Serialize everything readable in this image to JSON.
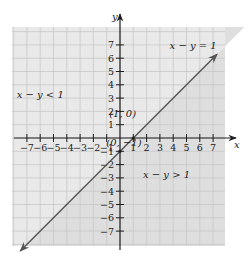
{
  "chart_data": {
    "type": "line",
    "title": "",
    "xlabel": "x",
    "ylabel": "y",
    "xlim": [
      -7,
      7
    ],
    "ylim": [
      -7,
      7
    ],
    "x_ticks": [
      -7,
      -6,
      -5,
      -4,
      -3,
      -2,
      -1,
      1,
      2,
      3,
      4,
      5,
      6,
      7
    ],
    "y_ticks": [
      -7,
      -6,
      -5,
      -4,
      -3,
      -2,
      -1,
      1,
      2,
      3,
      4,
      5,
      6,
      7
    ],
    "x_tick_labels": [
      "−7",
      "−6",
      "−5",
      "−4",
      "−3",
      "−2",
      "−1",
      "1",
      "2",
      "3",
      "4",
      "5",
      "6",
      "7"
    ],
    "y_tick_labels": [
      "−7",
      "−6",
      "−5",
      "−4",
      "−3",
      "−2",
      "−1",
      "1",
      "2",
      "3",
      "4",
      "5",
      "6",
      "7"
    ],
    "grid": true,
    "series": [
      {
        "name": "x − y = 1",
        "equation": "y = x - 1",
        "x": [
          -7.5,
          7.3
        ],
        "y": [
          -8.5,
          6.3
        ],
        "arrows": "both"
      }
    ],
    "points": [
      {
        "label": "(1, 0)",
        "x": 1,
        "y": 0
      },
      {
        "label": "(0, −1)",
        "x": 0,
        "y": -1
      }
    ],
    "regions": [
      {
        "label": "x − y < 1",
        "side": "upper-left",
        "shade": "#e8e8e8"
      },
      {
        "label": "x − y > 1",
        "side": "lower-right",
        "shade": "#dcdcdc"
      }
    ],
    "annotations": [
      {
        "text": "x − y = 1",
        "x": 5.5,
        "y": 6.7
      },
      {
        "text": "x − y < 1",
        "x": -6,
        "y": 3
      },
      {
        "text": "x − y > 1",
        "x": 3.5,
        "y": -3
      },
      {
        "text": "(1, 0)",
        "x": 0.2,
        "y": 1.6
      },
      {
        "text": "(0, −1)",
        "x": 0.3,
        "y": -0.6
      }
    ]
  },
  "labels": {
    "x_axis": "x",
    "y_axis": "y",
    "line_label": "x − y = 1",
    "region_less": "x − y < 1",
    "region_greater": "x − y > 1",
    "point_a": "(1, 0)",
    "point_b": "(0, −1)"
  },
  "colors": {
    "region_less": "#e9e9e9",
    "region_greater": "#dedede",
    "grid": "#c8c8c8",
    "axis": "#1e1e1e",
    "line": "#555555"
  }
}
